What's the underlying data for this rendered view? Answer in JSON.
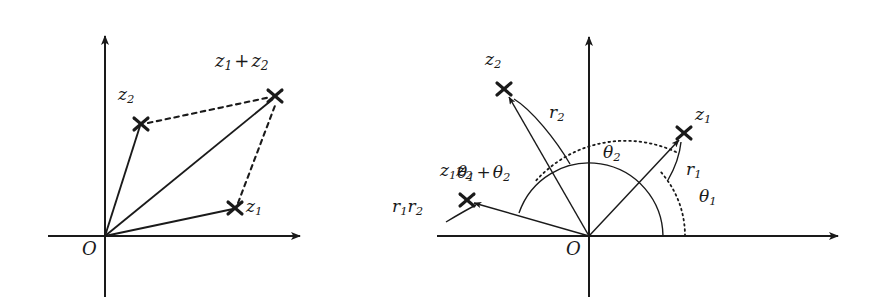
{
  "figure": {
    "width": 872,
    "height": 307,
    "background_color": "#ffffff",
    "line_color": "#1a1a1a",
    "text_color": "#1a1a1a"
  },
  "panels": [
    {
      "id": "left-panel",
      "name": "addition-diagram",
      "caption": "Addition of complex numbers by the parallelogram rule",
      "origin": {
        "x": 105,
        "y": 236
      },
      "axes": {
        "x_axis": {
          "x1": 48,
          "y1": 236,
          "x2": 305,
          "y2": 236,
          "arrow": "end"
        },
        "y_axis": {
          "x1": 105,
          "y1": 297,
          "x2": 105,
          "y2": 30,
          "arrow": "end"
        }
      },
      "points": [
        {
          "name": "z1",
          "label": "z₁",
          "label_sub": "1",
          "label_base": "z",
          "x": 235,
          "y": 208,
          "marker": "cross"
        },
        {
          "name": "z2",
          "label": "z₂",
          "label_sub": "2",
          "label_base": "z",
          "x": 141,
          "y": 124,
          "marker": "cross"
        },
        {
          "name": "z1plusz2",
          "label": "z₁ + z₂",
          "x": 275,
          "y": 96,
          "marker": "cross"
        }
      ],
      "solid_vectors": [
        {
          "name": "vector-to-z1",
          "from": "O",
          "to": "z1"
        },
        {
          "name": "vector-to-z2",
          "from": "O",
          "to": "z2"
        },
        {
          "name": "vector-to-sum",
          "from": "O",
          "to": "z1plusz2"
        }
      ],
      "dashed_edges": [
        {
          "name": "dashed-z2-to-sum",
          "from": "z2",
          "to": "z1plusz2"
        },
        {
          "name": "dashed-z1-to-sum",
          "from": "z1",
          "to": "z1plusz2"
        }
      ],
      "labels": [
        {
          "name": "label-origin-left",
          "text": "O",
          "x": 82,
          "y": 248
        },
        {
          "name": "label-z1-left",
          "text": "z",
          "sub": "1",
          "x": 247,
          "y": 203
        },
        {
          "name": "label-z2-left",
          "text": "z",
          "sub": "2",
          "x": 120,
          "y": 93
        },
        {
          "name": "label-z1-plus-z2",
          "text": "z",
          "sub": "1",
          "op": " + ",
          "text2": "z",
          "sub2": "2",
          "x": 217,
          "y": 57
        }
      ]
    },
    {
      "id": "right-panel",
      "name": "multiplication-diagram",
      "caption": "Multiplication of complex numbers: moduli multiply, arguments add",
      "origin": {
        "x": 589,
        "y": 236
      },
      "axes": {
        "x_axis": {
          "x1": 437,
          "y1": 236,
          "x2": 843,
          "y2": 236,
          "arrow": "end"
        },
        "y_axis": {
          "x1": 589,
          "y1": 297,
          "x2": 589,
          "y2": 31,
          "arrow": "end"
        }
      },
      "points": [
        {
          "name": "z1",
          "label": "z₁",
          "x": 684,
          "y": 133,
          "marker": "cross"
        },
        {
          "name": "z2",
          "label": "z₂",
          "x": 504,
          "y": 89,
          "marker": "cross"
        },
        {
          "name": "z1z2",
          "label": "z₁z₂",
          "x": 466,
          "y": 200,
          "marker": "cross"
        }
      ],
      "solid_vectors": [
        {
          "name": "vector-to-z1-right",
          "from": "O",
          "to": "z1",
          "arrow": "end"
        },
        {
          "name": "vector-to-z2-right",
          "from": "O",
          "to": "z2",
          "arrow": "end"
        },
        {
          "name": "vector-to-z1z2",
          "from": "O",
          "to": "z1z2",
          "arrow": "end"
        }
      ],
      "angle_arcs": [
        {
          "name": "arc-theta1",
          "style": "dotted",
          "radius": 96,
          "start_deg": 0,
          "end_deg": 43,
          "label": "θ₁"
        },
        {
          "name": "arc-theta2",
          "style": "dotted",
          "radius": 120,
          "start_deg": 43,
          "end_deg": 117,
          "label": "θ₂"
        },
        {
          "name": "arc-theta1-plus-theta2",
          "style": "solid",
          "radius": 74,
          "start_deg": 0,
          "end_deg": 160,
          "label": "θ₁ + θ₂"
        }
      ],
      "leader_lines": [
        {
          "name": "leader-r1",
          "from": {
            "x": 666,
            "y": 176
          },
          "to": {
            "x": 681,
            "y": 143
          }
        },
        {
          "name": "leader-r2",
          "from": {
            "x": 568,
            "y": 160
          },
          "to": {
            "x": 516,
            "y": 97
          }
        },
        {
          "name": "leader-r1r2",
          "from": {
            "x": 460,
            "y": 218
          },
          "to": {
            "x": 478,
            "y": 206
          }
        }
      ],
      "labels": [
        {
          "name": "label-origin-right",
          "text": "O",
          "x": 566,
          "y": 248
        },
        {
          "name": "label-z1-right",
          "text": "z",
          "sub": "1",
          "x": 696,
          "y": 112
        },
        {
          "name": "label-z2-right",
          "text": "z",
          "sub": "2",
          "x": 487,
          "y": 58
        },
        {
          "name": "label-z1z2",
          "text": "z",
          "sub": "1",
          "text2": "z",
          "sub2": "2",
          "x": 441,
          "y": 169
        },
        {
          "name": "label-r1",
          "text": "r",
          "sub": "1",
          "x": 688,
          "y": 168
        },
        {
          "name": "label-r2",
          "text": "r",
          "sub": "2",
          "x": 551,
          "y": 111
        },
        {
          "name": "label-r1r2",
          "text": "r",
          "sub": "1",
          "text2": "r",
          "sub2": "2",
          "x": 393,
          "y": 205
        },
        {
          "name": "label-theta1",
          "text": "θ",
          "sub": "1",
          "x": 700,
          "y": 195
        },
        {
          "name": "label-theta2",
          "text": "θ",
          "sub": "2",
          "x": 604,
          "y": 151
        },
        {
          "name": "label-theta1-plus-theta2",
          "text": "θ",
          "sub": "1",
          "op": " + ",
          "text2": "θ",
          "sub2": "2",
          "x": 459,
          "y": 171
        }
      ]
    }
  ],
  "text": {
    "z": "z",
    "r": "r",
    "theta": "θ",
    "O": "O",
    "sub1": "1",
    "sub2": "2",
    "plus": "+"
  }
}
